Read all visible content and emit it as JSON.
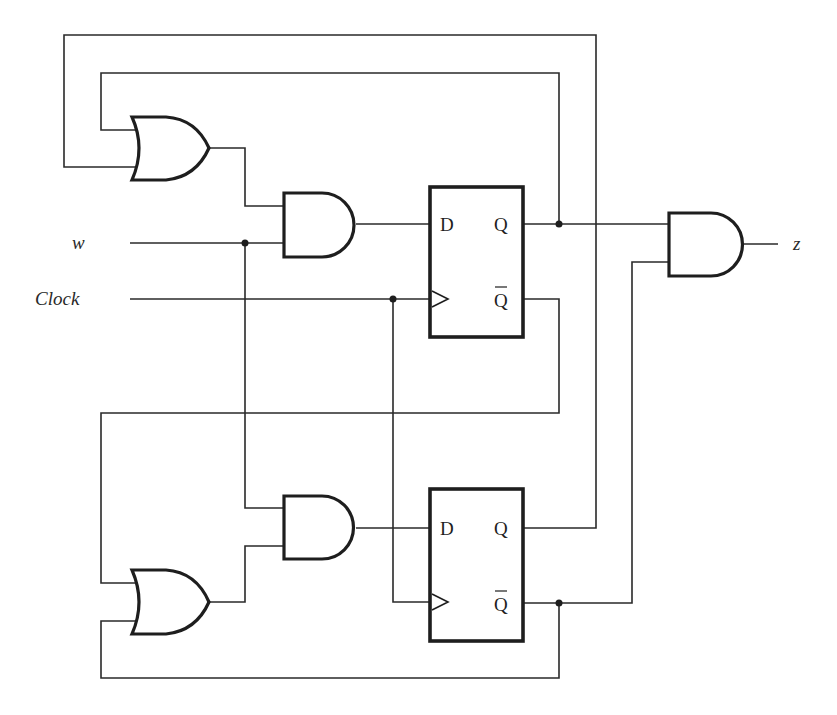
{
  "diagram": {
    "type": "sequential logic circuit",
    "inputs": {
      "w": "w",
      "clock": "Clock"
    },
    "output": {
      "z": "z"
    },
    "flip_flops": [
      {
        "id": "ff1",
        "pins": {
          "d": "D",
          "q": "Q",
          "qbar": "Q"
        }
      },
      {
        "id": "ff2",
        "pins": {
          "d": "D",
          "q": "Q",
          "qbar": "Q"
        }
      }
    ],
    "gates": [
      {
        "id": "or1",
        "type": "OR",
        "inputs": [
          "Q1 (ff1.Q)",
          "Q2 (ff2.Q)"
        ]
      },
      {
        "id": "and1",
        "type": "AND",
        "inputs": [
          "or1",
          "w"
        ],
        "drives": "ff1.D"
      },
      {
        "id": "or2",
        "type": "OR",
        "inputs": [
          "ff1.Qbar",
          "ff2.Qbar"
        ]
      },
      {
        "id": "and2",
        "type": "AND",
        "inputs": [
          "w",
          "or2"
        ],
        "drives": "ff2.D"
      },
      {
        "id": "and3",
        "type": "AND",
        "inputs": [
          "ff1.Q",
          "ff2.Qbar"
        ],
        "drives": "z"
      }
    ],
    "colors": {
      "line": "#2a2a2a",
      "background": "#ffffff"
    }
  }
}
